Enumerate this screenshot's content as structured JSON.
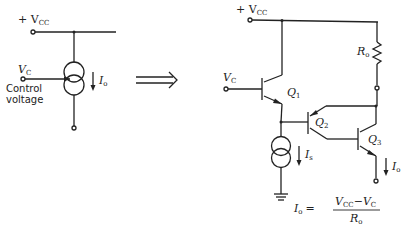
{
  "left_circuit": {
    "supply_label": "+ V",
    "supply_sub": "CC",
    "control_label": "V",
    "control_sub": "C",
    "control_text_line1": "Control",
    "control_text_line2": "voltage",
    "current_label": "I",
    "current_sub": "o"
  },
  "arrow": {
    "symbol": "implies-arrow"
  },
  "right_circuit": {
    "supply_label": "+ V",
    "supply_sub": "CC",
    "control_label": "V",
    "control_sub": "C",
    "transistors": [
      {
        "name": "Q",
        "sub": "1"
      },
      {
        "name": "Q",
        "sub": "2"
      },
      {
        "name": "Q",
        "sub": "3"
      }
    ],
    "resistor_label": "R",
    "resistor_sub": "o",
    "bias_current_label": "I",
    "bias_current_sub": "s",
    "output_current_label": "I",
    "output_current_sub": "o"
  },
  "equation": {
    "lhs": "I",
    "lhs_sub": "o",
    "equals": "=",
    "numerator": "V",
    "num_sub1": "CC",
    "num_minus": "−V",
    "num_sub2": "C",
    "denominator": "R",
    "den_sub": "o"
  }
}
